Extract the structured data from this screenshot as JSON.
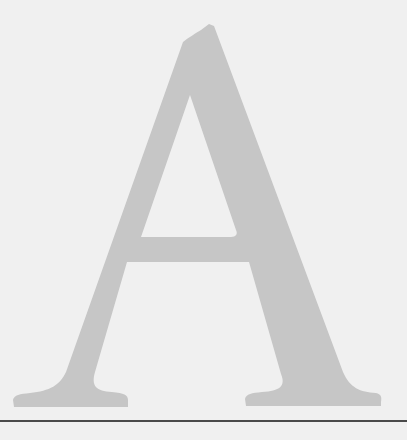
{
  "drop_cap": {
    "letter": "A",
    "fill_color": "#c6c6c6",
    "background_color": "#f0f0f0"
  },
  "rule": {
    "color": "#4a4a4a"
  }
}
